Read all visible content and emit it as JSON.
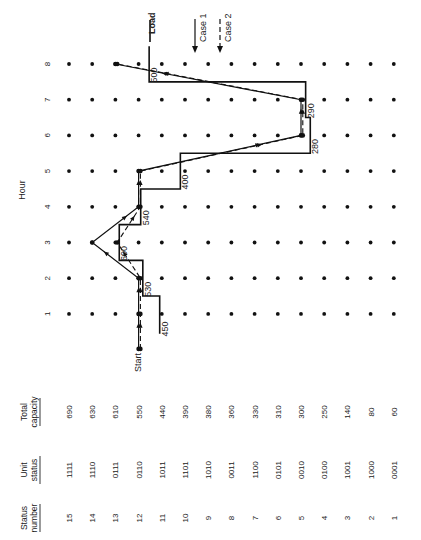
{
  "chart_data": {
    "type": "line",
    "title": "",
    "orientation": "rotated-90-ccw",
    "xlabel": "Status number",
    "ylabel": "Hour",
    "hours": [
      1,
      2,
      3,
      4,
      5,
      6,
      7,
      8
    ],
    "table": {
      "headers": {
        "status_number": [
          "Status",
          "number"
        ],
        "unit_status": [
          "Unit",
          "status"
        ],
        "total_capacity": [
          "Total",
          "capacity"
        ]
      },
      "rows": [
        {
          "status_number": "15",
          "unit_status": "1111",
          "total_capacity": "690"
        },
        {
          "status_number": "14",
          "unit_status": "1110",
          "total_capacity": "630"
        },
        {
          "status_number": "13",
          "unit_status": "0111",
          "total_capacity": "610"
        },
        {
          "status_number": "12",
          "unit_status": "0110",
          "total_capacity": "550"
        },
        {
          "status_number": "11",
          "unit_status": "1011",
          "total_capacity": "440"
        },
        {
          "status_number": "10",
          "unit_status": "1101",
          "total_capacity": "390"
        },
        {
          "status_number": "9",
          "unit_status": "1010",
          "total_capacity": "380"
        },
        {
          "status_number": "8",
          "unit_status": "0011",
          "total_capacity": "360"
        },
        {
          "status_number": "7",
          "unit_status": "1100",
          "total_capacity": "330"
        },
        {
          "status_number": "6",
          "unit_status": "0101",
          "total_capacity": "310"
        },
        {
          "status_number": "5",
          "unit_status": "0010",
          "total_capacity": "300"
        },
        {
          "status_number": "4",
          "unit_status": "0100",
          "total_capacity": "250"
        },
        {
          "status_number": "3",
          "unit_status": "1001",
          "total_capacity": "140"
        },
        {
          "status_number": "2",
          "unit_status": "1000",
          "total_capacity": "80"
        },
        {
          "status_number": "1",
          "unit_status": "0001",
          "total_capacity": "60"
        }
      ]
    },
    "load": {
      "name": "Load",
      "values": [
        450,
        530,
        600,
        540,
        400,
        280,
        290,
        500
      ],
      "labels": [
        "450",
        "530",
        "600",
        "540",
        "400",
        "280",
        "290",
        "500"
      ]
    },
    "series": [
      {
        "name": "Case 1",
        "style": "solid",
        "start_status": 12,
        "status_by_hour": [
          12,
          12,
          14,
          12,
          12,
          5,
          5,
          13
        ]
      },
      {
        "name": "Case 2",
        "style": "dashed",
        "start_status": 12,
        "status_by_hour": [
          12,
          12,
          13,
          12,
          12,
          5,
          5,
          13
        ]
      }
    ],
    "annotations": {
      "start": "Start",
      "load": "Load",
      "case1": "Case 1",
      "case2": "Case 2"
    },
    "grid": "dot-matrix (every status × every hour)",
    "legend": "top-right arrows"
  }
}
